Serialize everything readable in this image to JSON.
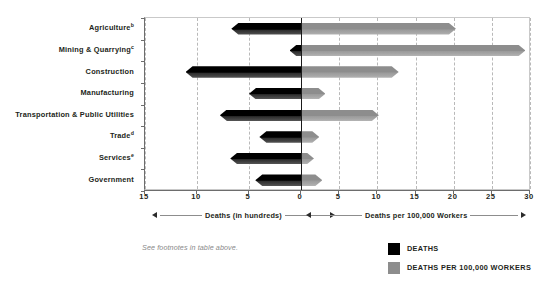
{
  "chart_data": {
    "type": "bar",
    "title": "",
    "subtitle": "",
    "orientation": "horizontal",
    "layout": "back-to-back bidirectional (butterfly) bar chart",
    "categories": [
      "Agriculture",
      "Mining & Quarrying",
      "Construction",
      "Manufacturing",
      "Transportation & Public Utilities",
      "Trade",
      "Services",
      "Government"
    ],
    "category_footnote_marks": [
      "b",
      "c",
      "",
      "",
      "",
      "d",
      "e",
      ""
    ],
    "series": [
      {
        "name": "DEATHS",
        "unit": "hundreds",
        "direction": "left",
        "color": "#000000",
        "axis": "left",
        "values": [
          6.7,
          1.1,
          11.1,
          5.0,
          7.8,
          4.0,
          6.8,
          4.4
        ]
      },
      {
        "name": "DEATHS PER 100,000 WORKERS",
        "unit": "deaths per 100,000 workers",
        "direction": "right",
        "color": "#8d8d8d",
        "axis": "right",
        "values": [
          20.3,
          29.4,
          12.8,
          3.2,
          10.2,
          2.4,
          1.7,
          2.8
        ]
      }
    ],
    "left_axis": {
      "label": "Deaths (in hundreds)",
      "ticks": [
        15,
        10,
        5,
        0
      ],
      "range": [
        15,
        0
      ],
      "reversed": true
    },
    "right_axis": {
      "label": "Deaths per 100,000 Workers",
      "ticks": [
        0,
        5,
        10,
        15,
        20,
        25,
        30
      ],
      "range": [
        0,
        30
      ]
    },
    "grid": "vertical dashed gridlines at each tick; solid black center line at zero",
    "legend_position": "bottom-right"
  },
  "axis": {
    "left_numbers": [
      "15",
      "10",
      "5",
      "0"
    ],
    "right_numbers": [
      "0",
      "5",
      "10",
      "15",
      "20",
      "25",
      "30"
    ],
    "left_caption": "Deaths (in hundreds)",
    "right_caption": "Deaths per 100,000 Workers"
  },
  "labels": [
    {
      "name": "Agriculture",
      "mark": "b"
    },
    {
      "name": "Mining & Quarrying",
      "mark": "c"
    },
    {
      "name": "Construction",
      "mark": ""
    },
    {
      "name": "Manufacturing",
      "mark": ""
    },
    {
      "name": "Transportation & Public Utilities",
      "mark": ""
    },
    {
      "name": "Trade",
      "mark": "d"
    },
    {
      "name": "Services",
      "mark": "e"
    },
    {
      "name": "Government",
      "mark": ""
    }
  ],
  "footnote": "See footnotes in table above.",
  "legend": [
    {
      "label": "DEATHS",
      "color": "#000000"
    },
    {
      "label": "DEATHS PER 100,000 WORKERS",
      "color": "#8d8d8d"
    }
  ]
}
